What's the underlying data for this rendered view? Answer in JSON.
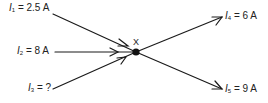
{
  "diagram": {
    "line_color": "#1a1a1a",
    "node": {
      "label": "X",
      "x": 136,
      "y": 52
    },
    "currents": [
      {
        "id": "I1",
        "symbol": "I",
        "subscript": "1",
        "equals": " = ",
        "value": "2.5 A",
        "direction": "in",
        "from": [
          53,
          14
        ],
        "label_pos": [
          9,
          2
        ]
      },
      {
        "id": "I2",
        "symbol": "I",
        "subscript": "2",
        "equals": " = ",
        "value": "8 A",
        "direction": "in",
        "from": [
          55,
          52
        ],
        "label_pos": [
          17,
          45
        ]
      },
      {
        "id": "I3",
        "symbol": "I",
        "subscript": "3",
        "equals": " = ",
        "value": "?",
        "direction": "in",
        "from": [
          53,
          89
        ],
        "label_pos": [
          28,
          82
        ]
      },
      {
        "id": "I4",
        "symbol": "I",
        "subscript": "4",
        "equals": " = ",
        "value": "6 A",
        "direction": "out",
        "to": [
          222,
          17
        ],
        "label_pos": [
          225,
          10
        ]
      },
      {
        "id": "I5",
        "symbol": "I",
        "subscript": "5",
        "equals": " = ",
        "value": "9 A",
        "direction": "out",
        "to": [
          222,
          89
        ],
        "label_pos": [
          225,
          83
        ]
      }
    ]
  }
}
